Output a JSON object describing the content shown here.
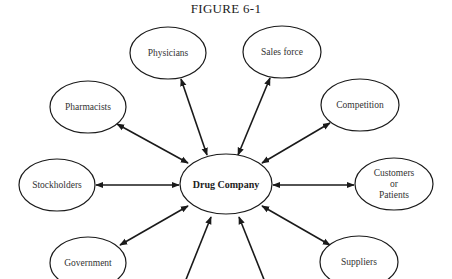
{
  "figure": {
    "title": "FIGURE 6-1"
  },
  "center_node": {
    "label": "Drug Company",
    "cx": 226,
    "cy": 184,
    "rx": 46,
    "ry": 30
  },
  "nodes": [
    {
      "id": "physicians",
      "label": "Physicians",
      "cx": 168,
      "cy": 53,
      "rx": 38,
      "ry": 26
    },
    {
      "id": "sales-force",
      "label": "Sales force",
      "cx": 282,
      "cy": 52,
      "rx": 39,
      "ry": 26
    },
    {
      "id": "pharmacists",
      "label": "Pharmacists",
      "cx": 88,
      "cy": 107,
      "rx": 38,
      "ry": 26
    },
    {
      "id": "competition",
      "label": "Competition",
      "cx": 360,
      "cy": 105,
      "rx": 39,
      "ry": 26
    },
    {
      "id": "stockholders",
      "label": "Stockholders",
      "cx": 57,
      "cy": 185,
      "rx": 38,
      "ry": 26
    },
    {
      "id": "customers-or-patients",
      "label": "Customers\nor\nPatients",
      "cx": 394,
      "cy": 184,
      "rx": 39,
      "ry": 26
    },
    {
      "id": "government",
      "label": "Government",
      "cx": 88,
      "cy": 263,
      "rx": 38,
      "ry": 26
    },
    {
      "id": "suppliers",
      "label": "Suppliers",
      "cx": 359,
      "cy": 262,
      "rx": 39,
      "ry": 26
    }
  ],
  "edges": [
    {
      "to": "physicians",
      "x1": 207,
      "y1": 155,
      "x2": 181,
      "y2": 79
    },
    {
      "to": "sales-force",
      "x1": 238,
      "y1": 155,
      "x2": 270,
      "y2": 78
    },
    {
      "to": "pharmacists",
      "x1": 188,
      "y1": 163,
      "x2": 117,
      "y2": 124
    },
    {
      "to": "competition",
      "x1": 262,
      "y1": 163,
      "x2": 330,
      "y2": 123
    },
    {
      "to": "stockholders",
      "x1": 179,
      "y1": 185,
      "x2": 96,
      "y2": 185
    },
    {
      "to": "customers-or-patients",
      "x1": 273,
      "y1": 185,
      "x2": 354,
      "y2": 185
    },
    {
      "to": "government",
      "x1": 188,
      "y1": 206,
      "x2": 120,
      "y2": 245
    },
    {
      "to": "suppliers",
      "x1": 262,
      "y1": 206,
      "x2": 330,
      "y2": 245
    },
    {
      "to": "offscreen-bottom-left",
      "x1": 211,
      "y1": 217,
      "x2": 185,
      "y2": 282
    },
    {
      "to": "offscreen-bottom-right",
      "x1": 239,
      "y1": 217,
      "x2": 265,
      "y2": 282
    }
  ],
  "colors": {
    "stroke": "#1a1a1a",
    "text": "#333333",
    "background": "#ffffff"
  }
}
